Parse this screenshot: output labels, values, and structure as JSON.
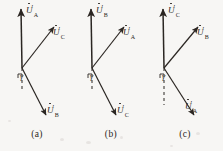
{
  "figure": {
    "type": "phasor-diagram-set",
    "background_color": "#f7f6f4",
    "ink_color": "#2b2622",
    "panels": [
      {
        "caption": "(a)",
        "origin": {
          "x": 22,
          "y": 68
        },
        "angle_label": "γ",
        "dashed_reference": {
          "from_y": 68,
          "to_y": 92
        },
        "vectors": [
          {
            "name": "vertical-phasor",
            "symbol": "U",
            "prime": "′",
            "subscript": "A",
            "tip": {
              "x": 21,
              "y": 7
            },
            "label_pos": {
              "x": 26,
              "y": 6
            }
          },
          {
            "name": "upper-right-phasor",
            "symbol": "U",
            "prime": "′",
            "subscript": "C",
            "tip": {
              "x": 56,
              "y": 25
            },
            "label_pos": {
              "x": 55,
              "y": 28
            }
          },
          {
            "name": "lower-right-phasor",
            "symbol": "U",
            "prime": "′",
            "subscript": "B",
            "tip": {
              "x": 48,
              "y": 118
            },
            "label_pos": {
              "x": 47,
              "y": 108
            }
          }
        ]
      },
      {
        "caption": "(b)",
        "origin": {
          "x": 18,
          "y": 68
        },
        "angle_label": "γ",
        "dashed_reference": {
          "from_y": 68,
          "to_y": 92
        },
        "vectors": [
          {
            "name": "vertical-phasor",
            "symbol": "U",
            "prime": "′",
            "subscript": "B",
            "tip": {
              "x": 17,
              "y": 7
            },
            "label_pos": {
              "x": 22,
              "y": 6
            }
          },
          {
            "name": "upper-right-phasor",
            "symbol": "U",
            "prime": "′",
            "subscript": "A",
            "tip": {
              "x": 52,
              "y": 25
            },
            "label_pos": {
              "x": 51,
              "y": 28
            }
          },
          {
            "name": "lower-right-phasor",
            "symbol": "U",
            "prime": "′",
            "subscript": "C",
            "tip": {
              "x": 44,
              "y": 118
            },
            "label_pos": {
              "x": 43,
              "y": 108
            }
          }
        ]
      },
      {
        "caption": "(c)",
        "origin": {
          "x": 16,
          "y": 68
        },
        "angle_label": "γ",
        "dashed_reference": {
          "from_y": 68,
          "to_y": 105
        },
        "vectors": [
          {
            "name": "vertical-phasor",
            "symbol": "U",
            "prime": "′",
            "subscript": "C",
            "tip": {
              "x": 15,
              "y": 7
            },
            "label_pos": {
              "x": 20,
              "y": 6
            }
          },
          {
            "name": "upper-right-phasor",
            "symbol": "U",
            "prime": "′",
            "subscript": "B",
            "tip": {
              "x": 52,
              "y": 25
            },
            "label_pos": {
              "x": 51,
              "y": 28
            }
          },
          {
            "name": "lower-right-phasor",
            "symbol": "U",
            "prime": "′",
            "subscript": "A",
            "tip": {
              "x": 48,
              "y": 118
            },
            "label_pos": {
              "x": 40,
              "y": 104
            }
          }
        ]
      }
    ]
  }
}
